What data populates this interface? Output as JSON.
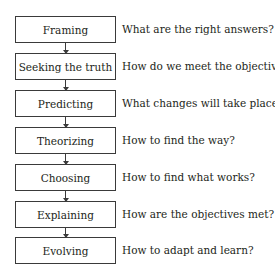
{
  "diagram": {
    "steps": [
      {
        "label": "Framing",
        "question": "What are the right answers?"
      },
      {
        "label": "Seeking the truth",
        "question": "How do we meet the objectives?"
      },
      {
        "label": "Predicting",
        "question": "What changes will take place?"
      },
      {
        "label": "Theorizing",
        "question": "How to find the way?"
      },
      {
        "label": "Choosing",
        "question": "How to find what works?"
      },
      {
        "label": "Explaining",
        "question": "How are the objectives met?"
      },
      {
        "label": "Evolving",
        "question": "How to adapt and learn?"
      }
    ]
  }
}
